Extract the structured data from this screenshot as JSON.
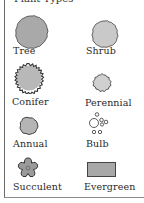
{
  "legend": {
    "title": "Plant Types",
    "items": [
      {
        "label": "Tree",
        "icon": "tree-icon",
        "fill": "#a9a9a9"
      },
      {
        "label": "Shrub",
        "icon": "shrub-icon",
        "fill": "#c9c9c9"
      },
      {
        "label": "Conifer",
        "icon": "conifer-icon",
        "fill": "#b8b8b8"
      },
      {
        "label": "Perennial",
        "icon": "perennial-icon",
        "fill": "#d0d0d0"
      },
      {
        "label": "Annual",
        "icon": "annual-icon",
        "fill": "#b5b5b5"
      },
      {
        "label": "Bulb",
        "icon": "bulb-icon",
        "fill": "#ffffff"
      },
      {
        "label": "Succulent",
        "icon": "succulent-icon",
        "fill": "#9a9a9a"
      },
      {
        "label": "Evergreen",
        "icon": "evergreen-icon",
        "fill": "#a8a8a8"
      }
    ]
  }
}
